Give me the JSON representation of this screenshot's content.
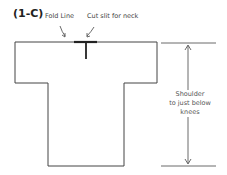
{
  "figure": {
    "label": "(1-C)"
  },
  "callouts": {
    "fold_line": "Fold Line",
    "cut_slit": "Cut slit for neck"
  },
  "measurement": {
    "line1": "Shoulder",
    "line2": "to just below",
    "line3": "knees"
  },
  "colors": {
    "outline": "#444444",
    "fold_bar": "#222222",
    "text": "#444444"
  }
}
